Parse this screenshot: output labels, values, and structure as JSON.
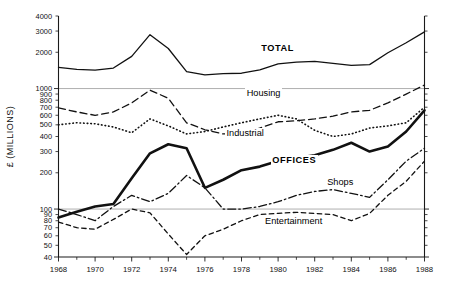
{
  "chart_data": {
    "type": "line",
    "title": "",
    "xlabel": "",
    "ylabel": "£ (MILLIONS)",
    "yscale": "log",
    "ylim": [
      40,
      4000
    ],
    "xlim": [
      1968,
      1988
    ],
    "grid": true,
    "gridlines_at": [
      1000,
      100
    ],
    "legend": "inline-labels",
    "y_ticks": [
      40,
      50,
      60,
      70,
      80,
      90,
      100,
      200,
      300,
      400,
      500,
      600,
      700,
      800,
      900,
      1000,
      2000,
      3000,
      4000
    ],
    "y_tick_labels": [
      "40",
      "50",
      "60",
      "70",
      "80",
      "90",
      "100",
      "200",
      "300",
      "400",
      "500",
      "600",
      "700",
      "800",
      "900",
      "1000",
      "2000",
      "3000",
      "4000"
    ],
    "x_ticks": [
      1968,
      1970,
      1972,
      1974,
      1976,
      1978,
      1980,
      1982,
      1984,
      1986,
      1988
    ],
    "x_tick_labels": [
      "1968",
      "1970",
      "1972",
      "1974",
      "1976",
      "1978",
      "1980",
      "1982",
      "1984",
      "1986",
      "1988"
    ],
    "x": [
      1968,
      1969,
      1970,
      1971,
      1972,
      1973,
      1974,
      1975,
      1976,
      1977,
      1978,
      1979,
      1980,
      1981,
      1982,
      1983,
      1984,
      1985,
      1986,
      1987,
      1988
    ],
    "series": [
      {
        "name": "TOTAL",
        "style": "solid",
        "linewidth": 1.3,
        "label_x": 1979.0,
        "label_y": 2150,
        "values": [
          1500,
          1440,
          1420,
          1480,
          1850,
          2800,
          2150,
          1380,
          1300,
          1330,
          1340,
          1430,
          1600,
          1660,
          1680,
          1620,
          1560,
          1580,
          1980,
          2400,
          2950
        ]
      },
      {
        "name": "Housing",
        "style": "dashed",
        "linewidth": 1.3,
        "label_x": 1978.2,
        "label_y": 900,
        "values": [
          690,
          640,
          600,
          640,
          760,
          970,
          830,
          520,
          455,
          420,
          420,
          470,
          530,
          540,
          560,
          590,
          640,
          660,
          760,
          900,
          1070
        ]
      },
      {
        "name": "Industrial",
        "style": "dotted",
        "linewidth": 1.6,
        "label_x": 1977.1,
        "label_y": 420,
        "values": [
          500,
          520,
          510,
          480,
          430,
          560,
          490,
          420,
          440,
          480,
          520,
          560,
          600,
          560,
          450,
          400,
          420,
          470,
          490,
          520,
          700
        ]
      },
      {
        "name": "OFFICES",
        "style": "solid",
        "linewidth": 2.6,
        "label_x": 1979.6,
        "label_y": 250,
        "values": [
          85,
          95,
          105,
          110,
          180,
          290,
          345,
          320,
          150,
          175,
          210,
          225,
          250,
          265,
          280,
          310,
          355,
          300,
          330,
          440,
          660
        ]
      },
      {
        "name": "Shops",
        "style": "dashdot",
        "linewidth": 1.3,
        "label_x": 1982.6,
        "label_y": 165,
        "values": [
          100,
          90,
          80,
          105,
          130,
          115,
          135,
          190,
          150,
          100,
          100,
          105,
          115,
          130,
          140,
          145,
          135,
          125,
          175,
          250,
          320
        ]
      },
      {
        "name": "Entertainment",
        "style": "dashed-short",
        "linewidth": 1.3,
        "label_x": 1979.2,
        "label_y": 78,
        "values": [
          78,
          70,
          68,
          82,
          100,
          93,
          62,
          42,
          60,
          68,
          80,
          90,
          92,
          94,
          92,
          90,
          80,
          92,
          130,
          170,
          250
        ]
      }
    ]
  }
}
